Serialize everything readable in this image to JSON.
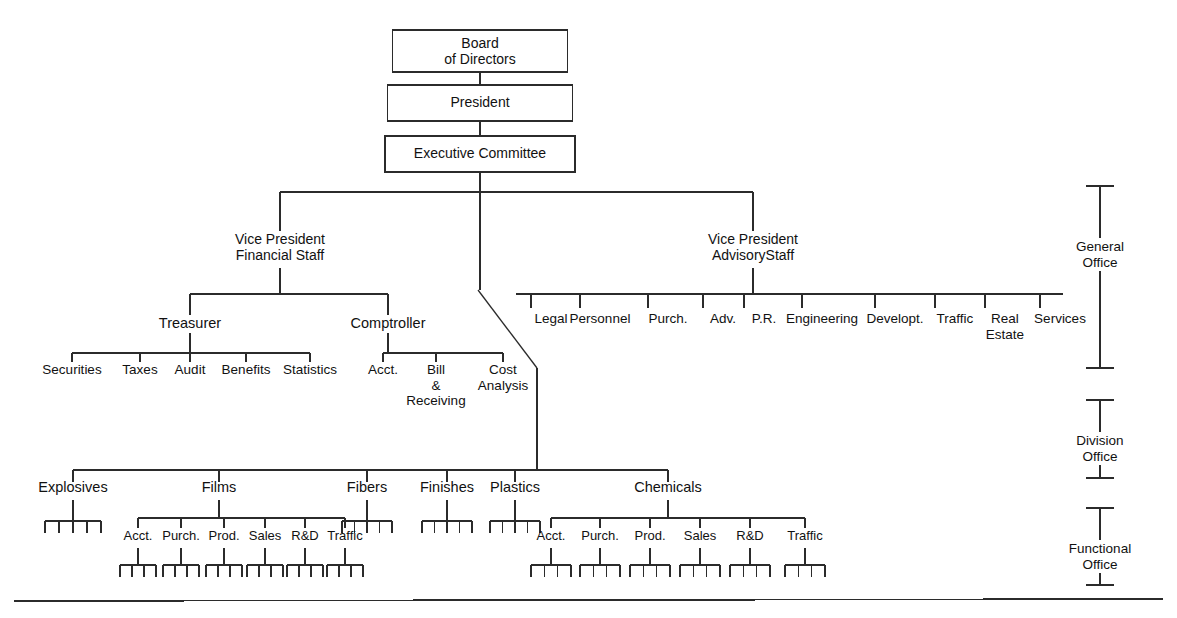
{
  "diagram": {
    "line_color": "#2b2b2b",
    "text_color": "#111111",
    "background": "#ffffff"
  },
  "top_boxes": [
    {
      "id": "board",
      "label": "Board\nof Directors",
      "cx": 480,
      "y": 30,
      "w": 175,
      "h": 42
    },
    {
      "id": "president",
      "label": "President",
      "cx": 480,
      "y": 85,
      "w": 185,
      "h": 36
    },
    {
      "id": "exec",
      "label": "Executive Committee",
      "cx": 480,
      "y": 136,
      "w": 190,
      "h": 36
    }
  ],
  "vice_presidents": [
    {
      "id": "vp-financial",
      "label": "Vice President\nFinancial Staff",
      "cx": 280,
      "y": 231
    },
    {
      "id": "vp-advisory",
      "label": "Vice President\nAdvisoryStaff",
      "cx": 753,
      "y": 231
    }
  ],
  "financial_staff": {
    "children": [
      {
        "id": "treasurer",
        "label": "Treasurer",
        "cx": 190,
        "y": 315
      },
      {
        "id": "comptroller",
        "label": "Comptroller",
        "cx": 388,
        "y": 315
      }
    ],
    "treasurer_reports": [
      {
        "label": "Securities",
        "cx": 72
      },
      {
        "label": "Taxes",
        "cx": 140
      },
      {
        "label": "Audit",
        "cx": 190
      },
      {
        "label": "Benefits",
        "cx": 246
      },
      {
        "label": "Statistics",
        "cx": 310
      }
    ],
    "comptroller_reports": [
      {
        "label": "Acct.",
        "cx": 383,
        "lines": 1
      },
      {
        "label": "Bill\n&\nReceiving",
        "cx": 436,
        "lines": 3
      },
      {
        "label": "Cost\nAnalysis",
        "cx": 503,
        "lines": 2
      }
    ]
  },
  "advisory_staff": {
    "items": [
      {
        "label": "Legal",
        "cx": 551
      },
      {
        "label": "Personnel",
        "cx": 600
      },
      {
        "label": "Purch.",
        "cx": 668
      },
      {
        "label": "Adv.",
        "cx": 723
      },
      {
        "label": "P.R.",
        "cx": 764
      },
      {
        "label": "Engineering",
        "cx": 822
      },
      {
        "label": "Developt.",
        "cx": 895
      },
      {
        "label": "Traffic",
        "cx": 955
      },
      {
        "label": "Real\nEstate",
        "cx": 1005
      },
      {
        "label": "Services",
        "cx": 1060
      }
    ]
  },
  "divisions": [
    {
      "id": "explosives",
      "label": "Explosives",
      "cx": 73,
      "sub": [],
      "comb": {
        "cx": 73,
        "teeth": 5,
        "w": 56
      }
    },
    {
      "id": "films",
      "label": "Films",
      "cx": 219,
      "comb": null
    },
    {
      "id": "fibers",
      "label": "Fibers",
      "cx": 367,
      "sub": [],
      "comb": {
        "cx": 367,
        "teeth": 5,
        "w": 50
      }
    },
    {
      "id": "finishes",
      "label": "Finishes",
      "cx": 447,
      "sub": [],
      "comb": {
        "cx": 447,
        "teeth": 5,
        "w": 50
      }
    },
    {
      "id": "plastics",
      "label": "Plastics",
      "cx": 515,
      "sub": [],
      "comb": {
        "cx": 515,
        "teeth": 5,
        "w": 50
      }
    },
    {
      "id": "chemicals",
      "label": "Chemicals",
      "cx": 668,
      "comb": null
    }
  ],
  "films_functions": [
    {
      "label": "Acct.",
      "cx": 138
    },
    {
      "label": "Purch.",
      "cx": 181
    },
    {
      "label": "Prod.",
      "cx": 224
    },
    {
      "label": "Sales",
      "cx": 265
    },
    {
      "label": "R&D",
      "cx": 305
    },
    {
      "label": "Traffic",
      "cx": 345
    }
  ],
  "chemicals_functions": [
    {
      "label": "Acct.",
      "cx": 551
    },
    {
      "label": "Purch.",
      "cx": 600
    },
    {
      "label": "Prod.",
      "cx": 650
    },
    {
      "label": "Sales",
      "cx": 700
    },
    {
      "label": "R&D",
      "cx": 750
    },
    {
      "label": "Traffic",
      "cx": 805
    }
  ],
  "legend_brackets": [
    {
      "id": "general-office",
      "label": "General\nOffice",
      "cx": 1100,
      "top": 186,
      "bottom": 368,
      "label_y": 238
    },
    {
      "id": "division-office",
      "label": "Division\nOffice",
      "cx": 1100,
      "top": 400,
      "bottom": 478,
      "label_y": 432
    },
    {
      "id": "functional-office",
      "label": "Functional\nOffice",
      "cx": 1100,
      "top": 508,
      "bottom": 585,
      "label_y": 540
    }
  ],
  "footer_rule": {
    "y": 601,
    "x1": 14,
    "x2": 1163
  }
}
